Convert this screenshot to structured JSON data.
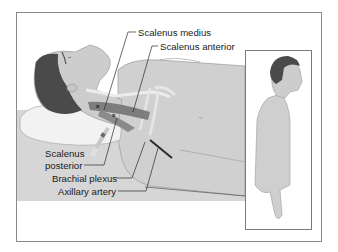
{
  "figure": {
    "type": "medical-illustration",
    "labels": {
      "scalenus_medius": "Scalenus medius",
      "scalenus_anterior": "Scalenus anterior",
      "scalenus_posterior_line1": "Scalenus",
      "scalenus_posterior_line2": "posterior",
      "brachial_plexus": "Brachial plexus",
      "axillary_artery": "Axillary artery"
    },
    "markers": [
      "x",
      "x"
    ],
    "colors": {
      "frame": "#8a8a8a",
      "bed": "#d4d4d4",
      "skin": "#cfcfcf",
      "hair": "#4a4a4a",
      "muscle": "#7d7d7d",
      "pillow": "#f2f2f2",
      "leader_line": "#2a2a2a"
    }
  }
}
